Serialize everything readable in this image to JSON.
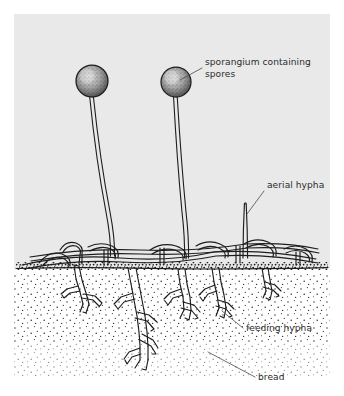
{
  "figure": {
    "name": "bread-mould-structure-diagram",
    "panel": {
      "background_color": "#e9e9e9",
      "x": 14,
      "y": 14,
      "width": 316,
      "height": 368
    },
    "ink_color": "#1d1d1d",
    "page_background": "#ffffff"
  },
  "labels": [
    {
      "id": "sporangium",
      "line1": "sporangium containing",
      "line2": "spores",
      "text_x": 205,
      "line1_y": 65,
      "line2_y": 77,
      "leader": {
        "x1": 202,
        "y1": 68,
        "x2": 180,
        "y2": 80
      }
    },
    {
      "id": "aerial-hypha",
      "line1": "aerial hypha",
      "line2": "",
      "text_x": 267,
      "line1_y": 188,
      "line2_y": 0,
      "leader": {
        "x1": 264,
        "y1": 191,
        "x2": 247,
        "y2": 214
      }
    },
    {
      "id": "feeding-hypha",
      "line1": "feeding hypha",
      "line2": "",
      "text_x": 246,
      "line1_y": 331,
      "line2_y": 0,
      "leader": {
        "x1": 243,
        "y1": 328,
        "x2": 222,
        "y2": 311
      }
    },
    {
      "id": "bread",
      "line1": "bread",
      "line2": "",
      "text_x": 258,
      "line1_y": 380,
      "line2_y": 0,
      "leader": {
        "x1": 255,
        "y1": 377,
        "x2": 208,
        "y2": 352
      }
    }
  ],
  "structures": {
    "sporangia": [
      {
        "id": "sporangium-left",
        "cx": 92,
        "cy": 81,
        "r": 16
      },
      {
        "id": "sporangium-right",
        "cx": 176,
        "cy": 82,
        "r": 15
      }
    ],
    "sporangiophores": [
      {
        "id": "stalk-left",
        "top_x": 93,
        "top_y": 96,
        "base_x": 112,
        "base_y": 252
      },
      {
        "id": "stalk-right",
        "top_x": 176,
        "top_y": 97,
        "base_x": 187,
        "base_y": 255
      }
    ],
    "aerial_hypha": {
      "id": "aerial-hypha-tube",
      "x": 245,
      "top_y": 203,
      "base_y": 258
    },
    "ground_line": {
      "id": "bread-surface-line",
      "y": 268,
      "x_start": 16,
      "x_end": 328
    },
    "bread_substrate": {
      "id": "bread-body",
      "y_top": 268,
      "y_bottom": 381,
      "stipple": true
    }
  }
}
